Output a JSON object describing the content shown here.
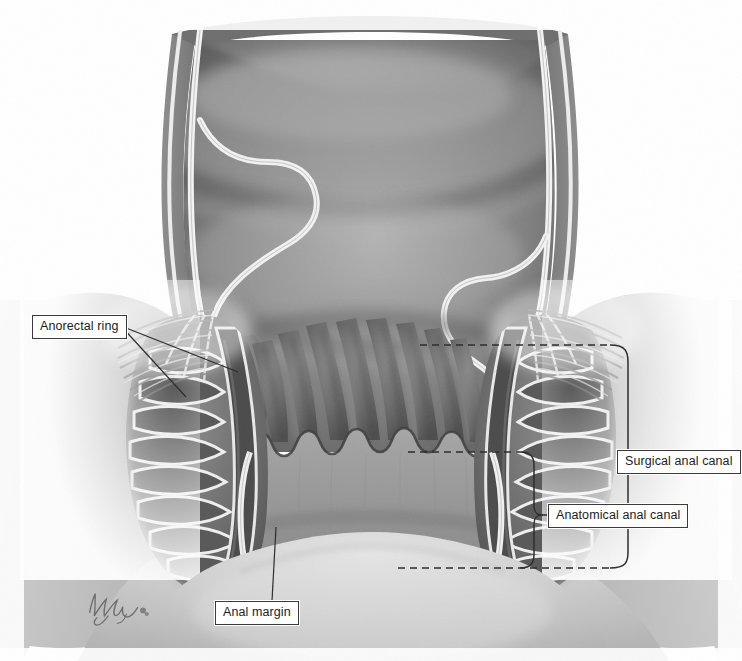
{
  "figure": {
    "background_color": "#ffffff",
    "rendering": "grayscale medical illustration"
  },
  "labels": [
    {
      "id": "anorectal-ring",
      "text": "Anorectal ring",
      "position": "left",
      "leader": "two converging pointer lines to upper left levator / puborectalis region"
    },
    {
      "id": "surgical-anal-canal",
      "text": "Surgical anal canal",
      "position": "right",
      "leader": "curly bracket spanning anorectal ring down to anal verge"
    },
    {
      "id": "anatomical-anal-canal",
      "text": "Anatomical anal canal",
      "position": "right",
      "leader": "curly bracket spanning dentate line down to anal verge"
    },
    {
      "id": "anal-margin",
      "text": "Anal margin",
      "position": "bottom-left",
      "leader": "straight pointer line up to perianal skin"
    }
  ],
  "annotations": {
    "dashed_guides": [
      {
        "id": "anorectal-ring-level",
        "y": 345,
        "label_ref": "surgical-anal-canal"
      },
      {
        "id": "dentate-line-level",
        "y": 452,
        "label_ref": "anatomical-anal-canal"
      },
      {
        "id": "anal-verge-level",
        "y": 568,
        "label_ref": "both-brackets"
      }
    ],
    "brackets": [
      {
        "id": "surgical-bracket",
        "top": 345,
        "bottom": 568,
        "x": 638
      },
      {
        "id": "anatomical-bracket",
        "top": 452,
        "bottom": 568,
        "x": 538
      }
    ]
  },
  "anatomy": {
    "structures": [
      "rectal ampulla",
      "rectal mucosa",
      "anal columns of Morgagni",
      "dentate line",
      "anal transitional zone",
      "internal anal sphincter",
      "external anal sphincter",
      "longitudinal muscle",
      "levator ani / puborectalis",
      "perianal skin",
      "anal verge"
    ]
  },
  "signature": {
    "present": true,
    "description": "artist cursive signature lower left"
  },
  "colors": {
    "outline": "#3a3a3a",
    "label_text": "#1c1c1c",
    "label_border": "#3a3a3a",
    "label_fill": "#ffffff",
    "tissue_dark": "#4a4a4a",
    "tissue_mid": "#7b7b7b",
    "tissue_light": "#b5b5b5",
    "lumen_shadow": "#5e5e5e",
    "highlight": "#efefef",
    "skin_tone": "#c9c9c9"
  }
}
